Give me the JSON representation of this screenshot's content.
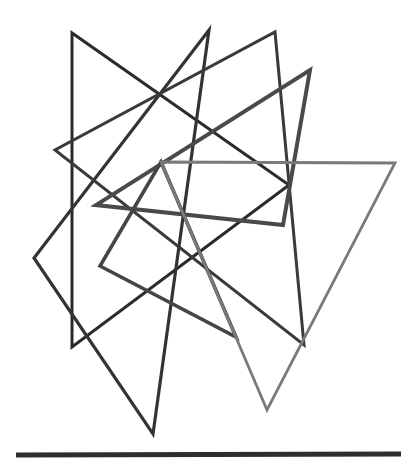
{
  "figure": {
    "canvas": {
      "width": 417,
      "height": 467,
      "background": "#ffffff"
    },
    "shapes": [
      {
        "name": "triangle-1-dark-left",
        "label": "Triangle 1",
        "color": "#2b2b2b",
        "stroke_width": 3.0,
        "points": "72,33 72,347 289,185"
      },
      {
        "name": "triangle-2-dark-center",
        "label": "Triangle 2",
        "color": "#333333",
        "stroke_width": 3.2,
        "points": "209,30 153,434 34,258"
      },
      {
        "name": "triangle-3-dark-right",
        "label": "Triangle 3",
        "color": "#3a3a3a",
        "stroke_width": 3.0,
        "points": "275,32 304,345 55,150"
      },
      {
        "name": "triangle-4-mid-wide",
        "label": "Triangle 4",
        "color": "#4a4a4a",
        "stroke_width": 4.0,
        "points": "310,70 283,225 96,205"
      },
      {
        "name": "triangle-5-mid-low",
        "label": "Triangle 5",
        "color": "#454545",
        "stroke_width": 3.6,
        "points": "100,266 236,337 161,162"
      },
      {
        "name": "triangle-6-light-right",
        "label": "Triangle 6",
        "color": "#7a7a7a",
        "stroke_width": 2.8,
        "points": "161,162 395,163 267,410"
      }
    ],
    "baseline": {
      "name": "baseline-rule",
      "label": "Baseline rule",
      "color": "#2e2e2e",
      "stroke_width": 5,
      "x1": 16,
      "y1": 455,
      "x2": 401,
      "y2": 454
    }
  }
}
